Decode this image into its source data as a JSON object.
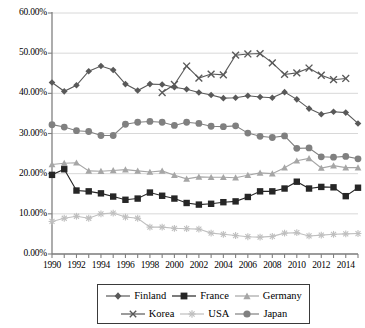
{
  "chart_data": {
    "type": "line",
    "title": "",
    "subtitle": "",
    "xlabel": "",
    "ylabel": "",
    "x": [
      1990,
      1991,
      1992,
      1993,
      1994,
      1995,
      1996,
      1997,
      1998,
      1999,
      2000,
      2001,
      2002,
      2003,
      2004,
      2005,
      2006,
      2007,
      2008,
      2009,
      2010,
      2011,
      2012,
      2013,
      2014,
      2015
    ],
    "xlim": [
      1990,
      2015
    ],
    "ylim": [
      0,
      60
    ],
    "ytick_values": [
      0,
      10,
      20,
      30,
      40,
      50,
      60
    ],
    "ytick_labels": [
      "0.00%",
      "10.00%",
      "20.00%",
      "30.00%",
      "40.00%",
      "50.00%",
      "60.00%"
    ],
    "xtick_labels": [
      "1990",
      "1992",
      "1994",
      "1996",
      "1998",
      "2000",
      "2002",
      "2004",
      "2006",
      "2008",
      "2010",
      "2012",
      "2014"
    ],
    "xtick_label_step": 2,
    "grid": "horizontal",
    "legend_position": "bottom",
    "series": [
      {
        "name": "Finland",
        "marker": "diamond",
        "color": "#595959",
        "values": [
          42.7,
          40.5,
          42.0,
          45.5,
          46.8,
          45.8,
          42.3,
          40.7,
          42.3,
          42.2,
          41.5,
          41.0,
          40.2,
          39.6,
          38.8,
          38.9,
          39.4,
          39.1,
          38.9,
          40.3,
          38.5,
          36.2,
          34.8,
          35.4,
          35.2,
          32.5
        ]
      },
      {
        "name": "France",
        "marker": "square",
        "color": "#262626",
        "values": [
          19.7,
          21.1,
          15.8,
          15.6,
          15.1,
          14.3,
          13.5,
          13.8,
          15.3,
          14.5,
          13.8,
          12.7,
          12.3,
          12.5,
          12.9,
          13.1,
          14.2,
          15.6,
          15.6,
          16.3,
          18.0,
          16.3,
          16.7,
          16.6,
          14.4,
          16.5
        ]
      },
      {
        "name": "Germany",
        "marker": "triangle",
        "color": "#a6a6a6",
        "values": [
          22.3,
          22.6,
          22.7,
          20.7,
          20.6,
          20.8,
          21.0,
          20.7,
          20.4,
          20.7,
          19.6,
          18.7,
          19.2,
          19.1,
          19.1,
          19.0,
          19.6,
          20.2,
          20.0,
          21.5,
          23.2,
          23.8,
          21.4,
          22.0,
          21.5,
          21.5
        ]
      },
      {
        "name": "Korea",
        "marker": "x",
        "color": "#595959",
        "values": [
          null,
          null,
          null,
          null,
          null,
          null,
          null,
          null,
          null,
          40.2,
          42.2,
          46.8,
          43.8,
          44.8,
          44.6,
          49.5,
          49.8,
          49.9,
          47.6,
          44.7,
          45.1,
          46.3,
          44.5,
          43.4,
          43.7,
          null
        ]
      },
      {
        "name": "USA",
        "marker": "asterisk",
        "color": "#bfbfbf",
        "values": [
          8.1,
          8.9,
          9.4,
          8.9,
          10.0,
          10.2,
          9.2,
          8.9,
          6.7,
          6.7,
          6.4,
          6.3,
          6.2,
          5.2,
          4.9,
          4.6,
          4.3,
          4.2,
          4.4,
          5.2,
          5.3,
          4.5,
          4.7,
          4.9,
          5.0,
          5.1
        ]
      },
      {
        "name": "Japan",
        "marker": "circle",
        "color": "#808080",
        "values": [
          32.2,
          31.6,
          30.7,
          30.5,
          29.5,
          29.5,
          32.3,
          32.8,
          33.0,
          32.8,
          32.0,
          32.8,
          32.5,
          31.8,
          31.7,
          31.9,
          30.1,
          29.3,
          29.0,
          29.4,
          26.3,
          26.4,
          24.2,
          24.1,
          24.3,
          23.7
        ]
      }
    ]
  },
  "legend": {
    "items": [
      {
        "label": "Finland"
      },
      {
        "label": "France"
      },
      {
        "label": "Germany"
      },
      {
        "label": "Korea"
      },
      {
        "label": "USA"
      },
      {
        "label": "Japan"
      }
    ]
  }
}
